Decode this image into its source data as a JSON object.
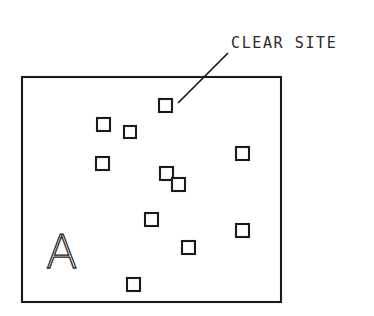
{
  "diagram": {
    "background_color": "#ffffff",
    "line_color": "#1a1a1a",
    "fill_color": "#ffffff"
  },
  "annotation": {
    "label": "CLEAR SITE",
    "text_x": 231,
    "text_y": 48,
    "leader": {
      "x1": 228,
      "y1": 53,
      "x2": 178,
      "y2": 103
    }
  },
  "parcel": {
    "letter": "A",
    "x": 46,
    "y": 268
  },
  "boundary": {
    "x": 22,
    "y": 77,
    "width": 259,
    "height": 225
  },
  "chart_data": {
    "type": "scatter",
    "title": "CLEAR SITE",
    "xlabel": "",
    "ylabel": "",
    "xlim": [
      22,
      281
    ],
    "ylim": [
      77,
      302
    ],
    "grid": false,
    "legend": null,
    "annotations": [
      "CLEAR SITE",
      "A"
    ],
    "marker": "open-square",
    "structures": [
      {
        "id": "s1",
        "x": 159,
        "y": 99,
        "size": 13
      },
      {
        "id": "s2",
        "x": 97,
        "y": 118,
        "size": 13
      },
      {
        "id": "s3",
        "x": 124,
        "y": 126,
        "size": 12
      },
      {
        "id": "s4",
        "x": 96,
        "y": 157,
        "size": 13
      },
      {
        "id": "s5",
        "x": 236,
        "y": 147,
        "size": 13
      },
      {
        "id": "s6",
        "x": 160,
        "y": 167,
        "size": 13
      },
      {
        "id": "s7",
        "x": 172,
        "y": 178,
        "size": 13
      },
      {
        "id": "s8",
        "x": 145,
        "y": 213,
        "size": 13
      },
      {
        "id": "s9",
        "x": 236,
        "y": 224,
        "size": 13
      },
      {
        "id": "s10",
        "x": 182,
        "y": 241,
        "size": 13
      },
      {
        "id": "s11",
        "x": 127,
        "y": 278,
        "size": 13
      }
    ]
  }
}
